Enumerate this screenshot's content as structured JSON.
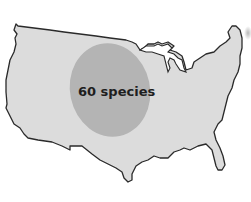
{
  "map": {
    "region": "contiguous United States",
    "label": "60 species",
    "colors": {
      "background": "#ffffff",
      "land_fill": "#dcdcdc",
      "outline": "#2a2a2a",
      "range_fill": "#b4b4b4",
      "label_text": "#1e1e1e"
    },
    "range_ellipse": {
      "cx": 110,
      "cy": 90,
      "rx": 40,
      "ry": 47
    }
  }
}
